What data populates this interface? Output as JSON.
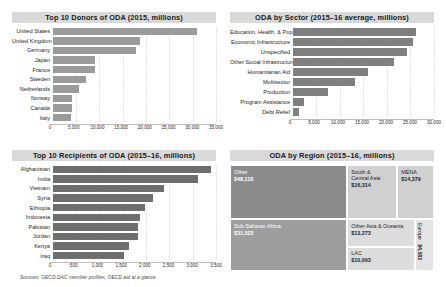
{
  "source_note": "Sources: OECD DAC member profiles, OECD aid at a glance",
  "panels": {
    "donors": {
      "title": "Top 10 Donors of ODA (2015, millions)"
    },
    "sector": {
      "title": "ODA by Sector (2015–16 average, millions)"
    },
    "recipients": {
      "title": "Top 10 Recipients of ODA (2015–16, millions)"
    },
    "region": {
      "title": "ODA by Region (2015–16, millions)"
    }
  },
  "chart_data": [
    {
      "type": "bar",
      "orientation": "horizontal",
      "title": "Top 10 Donors of ODA (2015, millions)",
      "xlabel": "",
      "ylabel": "",
      "xlim": [
        0,
        35000
      ],
      "grid": true,
      "ticks": [
        "0",
        "5,000",
        "10,000",
        "15,000",
        "20,000",
        "25,000",
        "30,000",
        "35,000"
      ],
      "tick_values": [
        0,
        5000,
        10000,
        15000,
        20000,
        25000,
        30000,
        35000
      ],
      "bar_color": "#9b9b9b",
      "categories": [
        "United States",
        "United Kingdom",
        "Germany",
        "Japan",
        "France",
        "Sweden",
        "Netherlands",
        "Norway",
        "Canada",
        "Italy"
      ],
      "values": [
        30986,
        18700,
        17940,
        9203,
        9039,
        7089,
        5726,
        4278,
        4277,
        4003
      ]
    },
    {
      "type": "bar",
      "orientation": "horizontal",
      "title": "ODA by Sector (2015–16 average, millions)",
      "xlabel": "",
      "ylabel": "",
      "xlim": [
        0,
        30000
      ],
      "grid": true,
      "ticks": [
        "0",
        "5,000",
        "10,000",
        "15,000",
        "20,000",
        "25,000",
        "30,000"
      ],
      "tick_values": [
        0,
        5000,
        10000,
        15000,
        20000,
        25000,
        30000
      ],
      "bar_color": "#7f7f7f",
      "categories": [
        "Education, Health, & Pop",
        "Economic Infrastructure",
        "Unspecified",
        "Other Social Infrastructure",
        "Humanitarian Aid",
        "Multisector",
        "Production",
        "Program Assistance",
        "Debt Relief"
      ],
      "values": [
        26100,
        25600,
        24300,
        21600,
        16000,
        13300,
        7600,
        2400,
        1400
      ]
    },
    {
      "type": "bar",
      "orientation": "horizontal",
      "title": "Top 10 Recipients of ODA (2015–16, millions)",
      "xlabel": "",
      "ylabel": "",
      "xlim": [
        0,
        3500
      ],
      "grid": true,
      "ticks": [
        "0",
        "500",
        "1,000",
        "1,500",
        "2,000",
        "2,500",
        "3,000",
        "3,500"
      ],
      "tick_values": [
        0,
        500,
        1000,
        1500,
        2000,
        2500,
        3000,
        3500
      ],
      "bar_color": "#6e6e6e",
      "categories": [
        "Afghanistan",
        "India",
        "Vietnam",
        "Syria",
        "Ethiopia",
        "Indonesia",
        "Pakistan",
        "Jordan",
        "Kenya",
        "Iraq"
      ],
      "values": [
        3400,
        3120,
        2390,
        2150,
        1980,
        1880,
        1840,
        1830,
        1640,
        1540
      ]
    },
    {
      "type": "treemap",
      "title": "ODA by Region (2015–16, millions)",
      "categories": [
        "Other",
        "Sub-Saharan Africa",
        "South & Central Asia",
        "MENA",
        "Other Asia & Oceania",
        "LAC",
        "Europe"
      ],
      "values": [
        48118,
        31522,
        16314,
        14379,
        13273,
        10093,
        4582
      ],
      "value_labels": [
        "$48,118",
        "$31,522",
        "$16,314",
        "$14,379",
        "$13,273",
        "$10,093",
        "$4,582"
      ]
    }
  ],
  "treemap_tiles": [
    {
      "name": "Other",
      "value": "$48,118",
      "color": "#8c8c8c",
      "text": "#ffffff",
      "x": 0,
      "y": 0,
      "w": 57.5,
      "h": 51,
      "vertical": false
    },
    {
      "name": "Sub-Saharan Africa",
      "value": "$31,522",
      "color": "#9e9e9e",
      "text": "#ffffff",
      "x": 0,
      "y": 51,
      "w": 57.5,
      "h": 49,
      "vertical": false
    },
    {
      "name": "South &\nCentral Asia",
      "value": "$16,314",
      "color": "#d0d0d0",
      "text": "#1e1e1e",
      "x": 57.5,
      "y": 0,
      "w": 24.5,
      "h": 51,
      "vertical": false
    },
    {
      "name": "MENA",
      "value": "$14,379",
      "color": "#d0d0d0",
      "text": "#1e1e1e",
      "x": 82,
      "y": 0,
      "w": 18,
      "h": 51,
      "vertical": false
    },
    {
      "name": "Other Asia & Oceania",
      "value": "$13,273",
      "color": "#dcdcdc",
      "text": "#1e1e1e",
      "x": 57.5,
      "y": 51,
      "w": 33,
      "h": 26,
      "vertical": false
    },
    {
      "name": "LAC",
      "value": "$10,093",
      "color": "#dcdcdc",
      "text": "#1e1e1e",
      "x": 57.5,
      "y": 77,
      "w": 33,
      "h": 23,
      "vertical": false
    },
    {
      "name": "Europe",
      "value": "$4,582",
      "color": "#e4e4e4",
      "text": "#1e1e1e",
      "x": 90.5,
      "y": 51,
      "w": 9.5,
      "h": 49,
      "vertical": true
    }
  ]
}
